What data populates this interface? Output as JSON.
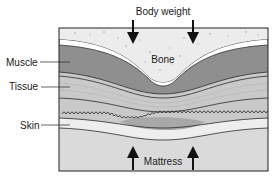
{
  "diagram": {
    "title_label": "Body weight",
    "bottom_label": "Mattress",
    "center_label": "Bone",
    "side_labels": [
      {
        "text": "Muscle"
      },
      {
        "text": "Tissue"
      },
      {
        "text": "Skin"
      }
    ],
    "arrows": {
      "top": "down-arrows (2) representing body weight",
      "bottom": "up-arrows (2) representing mattress pressure"
    },
    "colors": {
      "bone": "#ececec",
      "muscle": "#8f8f8f",
      "tissue": "#c9c9c9",
      "skin": "#e6e6e6",
      "compressed_area": "#a8a8a8",
      "mattress": "#dadada",
      "line": "#2a2a2a"
    }
  }
}
